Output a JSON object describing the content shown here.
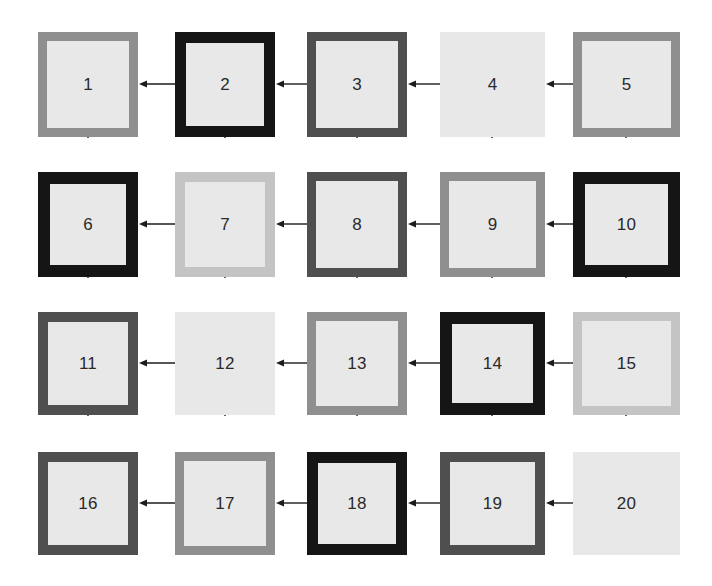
{
  "diagram": {
    "type": "flow-grid",
    "title": "",
    "background_color": "#ffffff",
    "box_fill_color": "#e8e8e8",
    "arrow_color": "#1c1c1c",
    "label_color": "#2a2a2a",
    "rows": 4,
    "columns": 5,
    "box_count": 20,
    "flow_description": "Serpentine flow: arrows point right-to-left across each row and upward between rows, leading from box 20 to box 1.",
    "border_styles": {
      "black": "#151515",
      "dark-gray": "#4f4f4f",
      "medium-gray": "#8f8f8f",
      "light-gray": "#c4c4c4",
      "none": "#e8e8e8"
    },
    "boxes": [
      {
        "id": 1,
        "label": "1",
        "row": 1,
        "col": 1,
        "x": 38,
        "y": 32,
        "w": 100,
        "h": 105,
        "border_width": 9,
        "border_color": "#8f8f8f",
        "border_style": "medium-gray"
      },
      {
        "id": 2,
        "label": "2",
        "row": 1,
        "col": 2,
        "x": 175,
        "y": 32,
        "w": 100,
        "h": 105,
        "border_width": 11,
        "border_color": "#151515",
        "border_style": "black"
      },
      {
        "id": 3,
        "label": "3",
        "row": 1,
        "col": 3,
        "x": 307,
        "y": 32,
        "w": 100,
        "h": 105,
        "border_width": 9,
        "border_color": "#4f4f4f",
        "border_style": "dark-gray"
      },
      {
        "id": 4,
        "label": "4",
        "row": 1,
        "col": 4,
        "x": 440,
        "y": 32,
        "w": 105,
        "h": 105,
        "border_width": 0,
        "border_color": "#e8e8e8",
        "border_style": "none"
      },
      {
        "id": 5,
        "label": "5",
        "row": 1,
        "col": 5,
        "x": 573,
        "y": 32,
        "w": 107,
        "h": 105,
        "border_width": 9,
        "border_color": "#8f8f8f",
        "border_style": "medium-gray"
      },
      {
        "id": 6,
        "label": "6",
        "row": 2,
        "col": 1,
        "x": 38,
        "y": 172,
        "w": 100,
        "h": 105,
        "border_width": 12,
        "border_color": "#151515",
        "border_style": "black"
      },
      {
        "id": 7,
        "label": "7",
        "row": 2,
        "col": 2,
        "x": 175,
        "y": 172,
        "w": 100,
        "h": 105,
        "border_width": 10,
        "border_color": "#c4c4c4",
        "border_style": "light-gray"
      },
      {
        "id": 8,
        "label": "8",
        "row": 2,
        "col": 3,
        "x": 307,
        "y": 172,
        "w": 100,
        "h": 105,
        "border_width": 9,
        "border_color": "#4f4f4f",
        "border_style": "dark-gray"
      },
      {
        "id": 9,
        "label": "9",
        "row": 2,
        "col": 4,
        "x": 440,
        "y": 172,
        "w": 105,
        "h": 105,
        "border_width": 9,
        "border_color": "#8f8f8f",
        "border_style": "medium-gray"
      },
      {
        "id": 10,
        "label": "10",
        "row": 2,
        "col": 5,
        "x": 573,
        "y": 172,
        "w": 107,
        "h": 105,
        "border_width": 12,
        "border_color": "#151515",
        "border_style": "black"
      },
      {
        "id": 11,
        "label": "11",
        "row": 3,
        "col": 1,
        "x": 38,
        "y": 312,
        "w": 100,
        "h": 103,
        "border_width": 10,
        "border_color": "#4f4f4f",
        "border_style": "dark-gray"
      },
      {
        "id": 12,
        "label": "12",
        "row": 3,
        "col": 2,
        "x": 175,
        "y": 312,
        "w": 100,
        "h": 103,
        "border_width": 0,
        "border_color": "#e8e8e8",
        "border_style": "none"
      },
      {
        "id": 13,
        "label": "13",
        "row": 3,
        "col": 3,
        "x": 307,
        "y": 312,
        "w": 100,
        "h": 103,
        "border_width": 9,
        "border_color": "#8f8f8f",
        "border_style": "medium-gray"
      },
      {
        "id": 14,
        "label": "14",
        "row": 3,
        "col": 4,
        "x": 440,
        "y": 312,
        "w": 105,
        "h": 103,
        "border_width": 12,
        "border_color": "#151515",
        "border_style": "black"
      },
      {
        "id": 15,
        "label": "15",
        "row": 3,
        "col": 5,
        "x": 573,
        "y": 312,
        "w": 107,
        "h": 103,
        "border_width": 9,
        "border_color": "#c4c4c4",
        "border_style": "light-gray"
      },
      {
        "id": 16,
        "label": "16",
        "row": 4,
        "col": 1,
        "x": 38,
        "y": 452,
        "w": 100,
        "h": 103,
        "border_width": 10,
        "border_color": "#4f4f4f",
        "border_style": "dark-gray"
      },
      {
        "id": 17,
        "label": "17",
        "row": 4,
        "col": 2,
        "x": 175,
        "y": 452,
        "w": 100,
        "h": 103,
        "border_width": 9,
        "border_color": "#8f8f8f",
        "border_style": "medium-gray"
      },
      {
        "id": 18,
        "label": "18",
        "row": 4,
        "col": 3,
        "x": 307,
        "y": 452,
        "w": 100,
        "h": 103,
        "border_width": 11,
        "border_color": "#151515",
        "border_style": "black"
      },
      {
        "id": 19,
        "label": "19",
        "row": 4,
        "col": 4,
        "x": 440,
        "y": 452,
        "w": 105,
        "h": 103,
        "border_width": 10,
        "border_color": "#4f4f4f",
        "border_style": "dark-gray"
      },
      {
        "id": 20,
        "label": "20",
        "row": 4,
        "col": 5,
        "x": 573,
        "y": 452,
        "w": 107,
        "h": 103,
        "border_width": 0,
        "border_color": "#e8e8e8",
        "border_style": "none"
      }
    ],
    "arrows": [
      {
        "id": "a2-1",
        "from": 2,
        "to": 1,
        "direction": "left",
        "x": 139,
        "y": 84,
        "length": 36
      },
      {
        "id": "a3-2",
        "from": 3,
        "to": 2,
        "direction": "left",
        "x": 276,
        "y": 84,
        "length": 31
      },
      {
        "id": "a4-3",
        "from": 4,
        "to": 3,
        "direction": "left",
        "x": 408,
        "y": 84,
        "length": 32
      },
      {
        "id": "a5-4",
        "from": 5,
        "to": 4,
        "direction": "left",
        "x": 546,
        "y": 84,
        "length": 27
      },
      {
        "id": "a7-6",
        "from": 7,
        "to": 6,
        "direction": "left",
        "x": 139,
        "y": 224,
        "length": 36
      },
      {
        "id": "a8-7",
        "from": 8,
        "to": 7,
        "direction": "left",
        "x": 276,
        "y": 224,
        "length": 31
      },
      {
        "id": "a9-8",
        "from": 9,
        "to": 8,
        "direction": "left",
        "x": 408,
        "y": 224,
        "length": 32
      },
      {
        "id": "a10-9",
        "from": 10,
        "to": 9,
        "direction": "left",
        "x": 546,
        "y": 224,
        "length": 27
      },
      {
        "id": "a12-11",
        "from": 12,
        "to": 11,
        "direction": "left",
        "x": 139,
        "y": 363,
        "length": 36
      },
      {
        "id": "a13-12",
        "from": 13,
        "to": 12,
        "direction": "left",
        "x": 276,
        "y": 363,
        "length": 31
      },
      {
        "id": "a14-13",
        "from": 14,
        "to": 13,
        "direction": "left",
        "x": 408,
        "y": 363,
        "length": 32
      },
      {
        "id": "a15-14",
        "from": 15,
        "to": 14,
        "direction": "left",
        "x": 546,
        "y": 363,
        "length": 27
      },
      {
        "id": "a17-16",
        "from": 17,
        "to": 16,
        "direction": "left",
        "x": 139,
        "y": 503,
        "length": 36
      },
      {
        "id": "a18-17",
        "from": 18,
        "to": 17,
        "direction": "left",
        "x": 276,
        "y": 503,
        "length": 31
      },
      {
        "id": "a19-18",
        "from": 19,
        "to": 18,
        "direction": "left",
        "x": 408,
        "y": 503,
        "length": 32
      },
      {
        "id": "a20-19",
        "from": 20,
        "to": 19,
        "direction": "left",
        "x": 546,
        "y": 503,
        "length": 27
      },
      {
        "id": "a6-1",
        "from": 6,
        "to": 1,
        "direction": "up",
        "x": 88,
        "y": 138,
        "length": 34
      },
      {
        "id": "a7-2",
        "from": 7,
        "to": 2,
        "direction": "up",
        "x": 225,
        "y": 138,
        "length": 34
      },
      {
        "id": "a8-3",
        "from": 8,
        "to": 3,
        "direction": "up",
        "x": 357,
        "y": 138,
        "length": 34
      },
      {
        "id": "a9-4",
        "from": 9,
        "to": 4,
        "direction": "up",
        "x": 492,
        "y": 138,
        "length": 34
      },
      {
        "id": "a10-5",
        "from": 10,
        "to": 5,
        "direction": "up",
        "x": 626,
        "y": 138,
        "length": 34
      },
      {
        "id": "a11-6",
        "from": 11,
        "to": 6,
        "direction": "up",
        "x": 88,
        "y": 278,
        "length": 34
      },
      {
        "id": "a12-7",
        "from": 12,
        "to": 7,
        "direction": "up",
        "x": 225,
        "y": 278,
        "length": 34
      },
      {
        "id": "a13-8",
        "from": 13,
        "to": 8,
        "direction": "up",
        "x": 357,
        "y": 278,
        "length": 34
      },
      {
        "id": "a14-9",
        "from": 14,
        "to": 9,
        "direction": "up",
        "x": 492,
        "y": 278,
        "length": 34
      },
      {
        "id": "a15-10",
        "from": 15,
        "to": 10,
        "direction": "up",
        "x": 626,
        "y": 278,
        "length": 34
      },
      {
        "id": "a16-11",
        "from": 16,
        "to": 11,
        "direction": "up",
        "x": 88,
        "y": 416,
        "length": 36
      },
      {
        "id": "a17-12",
        "from": 17,
        "to": 12,
        "direction": "up",
        "x": 225,
        "y": 416,
        "length": 36
      },
      {
        "id": "a18-13",
        "from": 18,
        "to": 13,
        "direction": "up",
        "x": 357,
        "y": 416,
        "length": 36
      },
      {
        "id": "a19-14",
        "from": 19,
        "to": 14,
        "direction": "up",
        "x": 492,
        "y": 416,
        "length": 36
      },
      {
        "id": "a20-15",
        "from": 20,
        "to": 15,
        "direction": "up",
        "x": 626,
        "y": 416,
        "length": 36
      }
    ]
  }
}
